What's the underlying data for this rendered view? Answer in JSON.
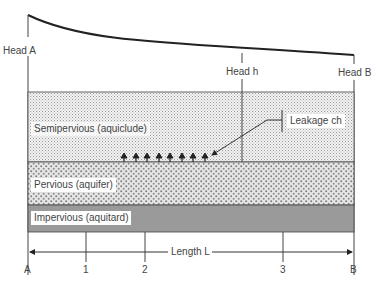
{
  "diagram": {
    "heads": {
      "head_a": "Head A",
      "head_h": "Head h",
      "head_b": "Head B"
    },
    "layers": [
      {
        "name": "Semipervious (aquiclude)",
        "pattern": "fine-dots"
      },
      {
        "name": "Pervious (aquifer)",
        "pattern": "coarse-dots"
      },
      {
        "name": "Impervious (aquitard)",
        "pattern": "solid-gray",
        "color": "#9a9a9a"
      }
    ],
    "leakage_label": "Leakage ch",
    "length_label": "Length L",
    "stations": [
      "A",
      "1",
      "2",
      "3",
      "B"
    ],
    "leakage_arrow_count": 8,
    "colors": {
      "line": "#222222",
      "impervious": "#9a9a9a",
      "text": "#444444"
    }
  }
}
